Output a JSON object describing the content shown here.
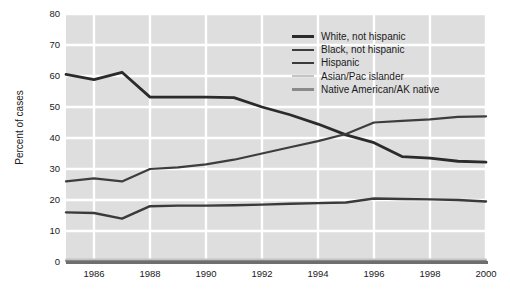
{
  "chart_data": {
    "type": "line",
    "title": "",
    "xlabel": "",
    "ylabel": "Percent of cases",
    "xlim": [
      1985,
      2000
    ],
    "ylim": [
      0,
      80
    ],
    "xticks": [
      1986,
      1988,
      1990,
      1992,
      1994,
      1996,
      1998,
      2000
    ],
    "yticks": [
      0,
      10,
      20,
      30,
      40,
      50,
      60,
      70,
      80
    ],
    "grid": true,
    "legend_position": "top-right",
    "x": [
      1985,
      1986,
      1987,
      1988,
      1989,
      1990,
      1991,
      1992,
      1993,
      1994,
      1995,
      1996,
      1997,
      1998,
      1999,
      2000
    ],
    "series": [
      {
        "name": "White, not hispanic",
        "color": "#2b2b2b",
        "width": 2.8,
        "values": [
          60.5,
          58.8,
          61.2,
          53.2,
          53.2,
          53.2,
          53.0,
          50.0,
          47.5,
          44.5,
          41.0,
          38.5,
          34.0,
          33.5,
          32.5,
          32.2
        ]
      },
      {
        "name": "Black, not hispanic",
        "color": "#3d3d3d",
        "width": 2.2,
        "values": [
          26.0,
          27.0,
          26.0,
          30.0,
          30.5,
          31.5,
          33.0,
          35.0,
          37.0,
          39.0,
          41.3,
          45.0,
          45.5,
          46.0,
          46.8,
          47.0
        ]
      },
      {
        "name": "Hispanic",
        "color": "#3a3a3a",
        "width": 2.4,
        "values": [
          16.0,
          15.8,
          14.0,
          18.0,
          18.2,
          18.2,
          18.3,
          18.5,
          18.8,
          19.0,
          19.2,
          20.5,
          20.3,
          20.2,
          20.0,
          19.5
        ]
      },
      {
        "name": "Asian/Pac islander",
        "color": "#c4c4c4",
        "width": 2.0,
        "values": [
          0.8,
          0.8,
          0.8,
          0.8,
          0.8,
          0.8,
          0.8,
          0.8,
          0.8,
          0.8,
          0.8,
          0.8,
          0.8,
          0.8,
          0.8,
          0.8
        ]
      },
      {
        "name": "Native American/AK native",
        "color": "#8a8a8a",
        "width": 2.0,
        "values": [
          0.3,
          0.3,
          0.3,
          0.3,
          0.3,
          0.3,
          0.3,
          0.3,
          0.3,
          0.3,
          0.3,
          0.3,
          0.3,
          0.3,
          0.3,
          0.3
        ]
      }
    ]
  },
  "style": {
    "plot_background": "#dedede",
    "gridline_color": "#ffffff",
    "axis_color": "#6e6e6e",
    "text_color": "#1a1a1a"
  }
}
